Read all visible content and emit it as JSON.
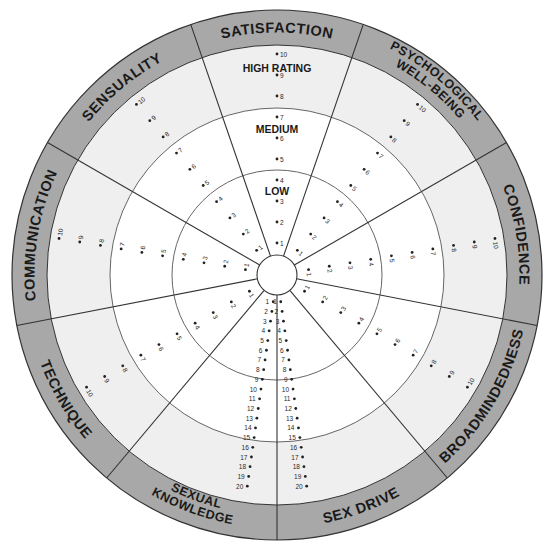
{
  "colors": {
    "background": "#ffffff",
    "outer_band": "#a8a8a8",
    "high_zone": "#efefef",
    "medium_zone": "#ffffff",
    "low_zone": "#ffffff",
    "hub": "#ffffff",
    "lines": "#333333",
    "text": "#1a1a1a"
  },
  "geometry": {
    "center": [
      277,
      275
    ],
    "r_hub": 20,
    "r_low": 105,
    "r_medium": 167,
    "r_high": 230,
    "r_outer": 265
  },
  "zone_labels": {
    "high": "HIGH RATING",
    "medium": "MEDIUM",
    "low": "LOW"
  },
  "segments": [
    {
      "id": "satisfaction",
      "label": [
        "SATISFACTION"
      ],
      "start_deg": -19,
      "end_deg": 19,
      "scale_max": 10
    },
    {
      "id": "psychological-well-being",
      "label": [
        "PSYCHOLOGICAL",
        "WELL-BEING"
      ],
      "start_deg": 19,
      "end_deg": 60,
      "scale_max": 10
    },
    {
      "id": "confidence",
      "label": [
        "CONFIDENCE"
      ],
      "start_deg": 60,
      "end_deg": 101,
      "scale_max": 10
    },
    {
      "id": "broadmindedness",
      "label": [
        "BROADMINDEDNESS"
      ],
      "start_deg": 101,
      "end_deg": 140,
      "scale_max": 10
    },
    {
      "id": "sex-drive",
      "label": [
        "SEX DRIVE"
      ],
      "start_deg": 140,
      "end_deg": 180,
      "scale_max": 20
    },
    {
      "id": "sexual-knowledge",
      "label": [
        "SEXUAL",
        "KNOWLEDGE"
      ],
      "start_deg": 180,
      "end_deg": 220,
      "scale_max": 20
    },
    {
      "id": "technique",
      "label": [
        "TECHNIQUE"
      ],
      "start_deg": 220,
      "end_deg": 259,
      "scale_max": 10
    },
    {
      "id": "communication",
      "label": [
        "COMMUNICATION"
      ],
      "start_deg": 259,
      "end_deg": 300,
      "scale_max": 10
    },
    {
      "id": "sensuality",
      "label": [
        "SENSUALITY"
      ],
      "start_deg": 300,
      "end_deg": 341,
      "scale_max": 10
    }
  ],
  "scale_points": {
    "ten_point": [
      "1",
      "2",
      "3",
      "4",
      "5",
      "6",
      "7",
      "8",
      "9",
      "10"
    ],
    "twenty_point": [
      "1",
      "2",
      "3",
      "4",
      "5",
      "6",
      "7",
      "8",
      "9",
      "10",
      "11",
      "12",
      "13",
      "14",
      "15",
      "16",
      "17",
      "18",
      "19",
      "20"
    ]
  },
  "scale_radii": {
    "ten_point": {
      "first": 32,
      "step": 21
    },
    "twenty_point": {
      "first": 27,
      "step": 9.8
    }
  },
  "point_axis_offset_deg": {
    "sex-drive": 172,
    "sexual-knowledge": 188
  }
}
